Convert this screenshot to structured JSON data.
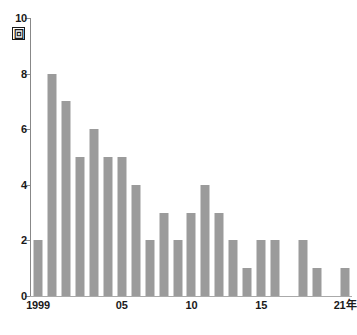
{
  "chart_data": {
    "type": "bar",
    "title": "",
    "subtitle": "",
    "xlabel": "",
    "ylabel": "回",
    "ylim": [
      0,
      10
    ],
    "xlim_years": [
      1999,
      2021
    ],
    "grid": false,
    "legend": null,
    "bar_color": "#9b9b9b",
    "axis_color": "#888888",
    "text_color": "#1a1a1a",
    "y_ticks": [
      0,
      2,
      4,
      6,
      8,
      10
    ],
    "y_tick_labels": [
      "0",
      "2",
      "4",
      "6",
      "8",
      "10"
    ],
    "y_unit_label": "回",
    "categories": [
      "1999",
      "2000",
      "2001",
      "2002",
      "2003",
      "2004",
      "2005",
      "2006",
      "2007",
      "2008",
      "2009",
      "2010",
      "2011",
      "2012",
      "2013",
      "2014",
      "2015",
      "2016",
      "2017",
      "2018",
      "2019",
      "2020",
      "2021"
    ],
    "values": [
      2,
      8,
      7,
      5,
      6,
      5,
      5,
      4,
      2,
      3,
      2,
      3,
      4,
      3,
      2,
      1,
      2,
      2,
      0,
      2,
      1,
      0,
      1
    ],
    "x_tick_labels": [
      {
        "index": 0,
        "label": "1999"
      },
      {
        "index": 6,
        "label": "05"
      },
      {
        "index": 11,
        "label": "10"
      },
      {
        "index": 16,
        "label": "15"
      },
      {
        "index": 22,
        "label": "21年"
      }
    ]
  }
}
